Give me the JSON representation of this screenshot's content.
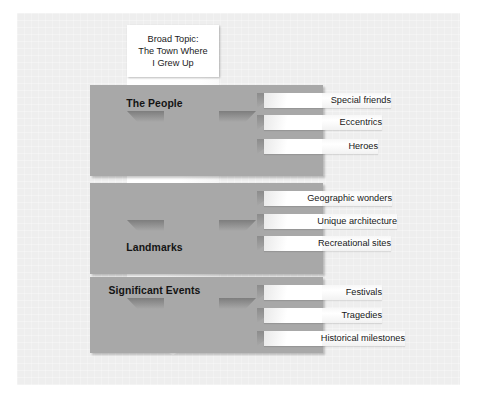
{
  "diagram": {
    "title_box": {
      "label": "Broad Topic:\nThe Town Where\nI Grew Up"
    },
    "accent_colors": {
      "band": "#a8a8a8",
      "canvas": "#eeeeee",
      "spine": "#ffffff",
      "text": "#141414"
    },
    "branches": [
      {
        "heading": "The People",
        "subtopics": [
          "Special friends",
          "Eccentrics",
          "Heroes"
        ]
      },
      {
        "heading": "Landmarks",
        "subtopics": [
          "Geographic wonders",
          "Unique architecture",
          "Recreational sites"
        ]
      },
      {
        "heading": "Significant Events",
        "subtopics": [
          "Festivals",
          "Tragedies",
          "Historical milestones"
        ]
      }
    ]
  }
}
